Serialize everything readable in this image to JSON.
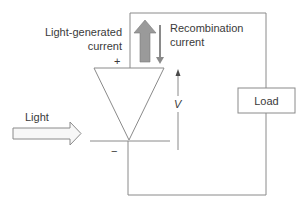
{
  "diagram": {
    "type": "solar-cell-equivalent-circuit",
    "labels": {
      "light_generated_current_line1": "Light-generated",
      "light_generated_current_line2": "current",
      "recombination_current_line1": "Recombination",
      "recombination_current_line2": "current",
      "light": "Light",
      "load": "Load",
      "voltage": "V",
      "plus": "+",
      "minus": "−"
    },
    "colors": {
      "line": "#8a8a8a",
      "thick_arrow_fill": "#9a9a9a",
      "thin_arrow": "#8a8a8a",
      "light_arrow_fill": "#f7f7f7",
      "text": "#3a3a3a"
    }
  }
}
